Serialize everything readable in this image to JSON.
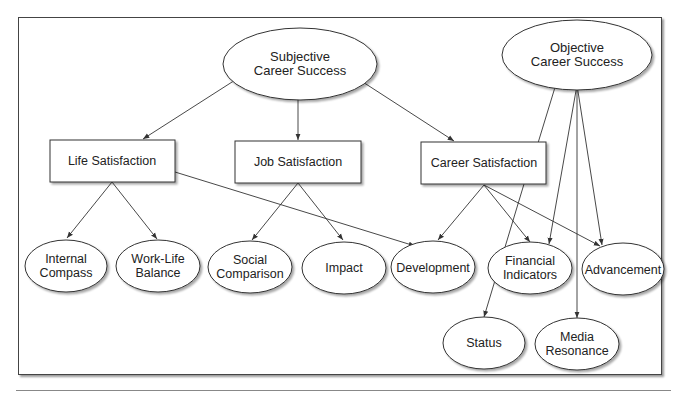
{
  "diagram": {
    "type": "hierarchy",
    "title": "",
    "nodes": {
      "subjective": {
        "lines": [
          "Subjective",
          "Career Success"
        ],
        "shape": "ellipse"
      },
      "objective": {
        "lines": [
          "Objective",
          "Career Success"
        ],
        "shape": "ellipse"
      },
      "life_satisfaction": {
        "label": "Life Satisfaction",
        "shape": "box"
      },
      "job_satisfaction": {
        "label": "Job Satisfaction",
        "shape": "box"
      },
      "career_satisfaction": {
        "label": "Career Satisfaction",
        "shape": "box"
      },
      "internal_compass": {
        "lines": [
          "Internal",
          "Compass"
        ],
        "shape": "ellipse"
      },
      "work_life_balance": {
        "lines": [
          "Work-Life",
          "Balance"
        ],
        "shape": "ellipse"
      },
      "social_comparison": {
        "lines": [
          "Social",
          "Comparison"
        ],
        "shape": "ellipse"
      },
      "impact": {
        "label": "Impact",
        "shape": "ellipse"
      },
      "development": {
        "label": "Development",
        "shape": "ellipse"
      },
      "financial_indicators": {
        "lines": [
          "Financial",
          "Indicators"
        ],
        "shape": "ellipse"
      },
      "advancement": {
        "label": "Advancement",
        "shape": "ellipse"
      },
      "status": {
        "label": "Status",
        "shape": "ellipse"
      },
      "media_resonance": {
        "lines": [
          "Media",
          "Resonance"
        ],
        "shape": "ellipse"
      }
    },
    "edges": [
      [
        "Subjective Career Success",
        "Life Satisfaction"
      ],
      [
        "Subjective Career Success",
        "Job Satisfaction"
      ],
      [
        "Subjective Career Success",
        "Career Satisfaction"
      ],
      [
        "Life Satisfaction",
        "Internal Compass"
      ],
      [
        "Life Satisfaction",
        "Work-Life Balance"
      ],
      [
        "Life Satisfaction",
        "Development"
      ],
      [
        "Job Satisfaction",
        "Social Comparison"
      ],
      [
        "Job Satisfaction",
        "Impact"
      ],
      [
        "Career Satisfaction",
        "Development"
      ],
      [
        "Career Satisfaction",
        "Financial Indicators"
      ],
      [
        "Career Satisfaction",
        "Advancement"
      ],
      [
        "Objective Career Success",
        "Status"
      ],
      [
        "Objective Career Success",
        "Financial Indicators"
      ],
      [
        "Objective Career Success",
        "Media Resonance"
      ],
      [
        "Objective Career Success",
        "Advancement"
      ]
    ]
  },
  "colors": {
    "stroke": "#333333",
    "text": "#222222",
    "background": "#ffffff"
  }
}
